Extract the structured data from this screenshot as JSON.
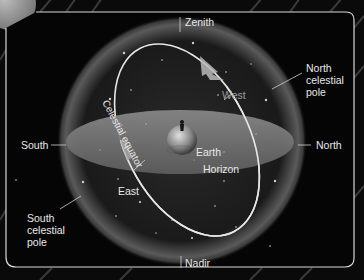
{
  "diagram": {
    "labels": {
      "zenith": "Zenith",
      "nadir": "Nadir",
      "north": "North",
      "south": "South",
      "east": "East",
      "west": "West",
      "earth": "Earth",
      "horizon": "Horizon",
      "celestial_equator": "Celestial equator",
      "north_celestial_pole": "North celestial pole",
      "south_celestial_pole": "South celestial pole"
    },
    "colors": {
      "background": "#0a0a0a",
      "frame": "#d8d8d8",
      "sphere_glow": "#6e6e6e",
      "horizon_disk": "#7a7a7a",
      "equator_ring": "#e6e6e6",
      "arrow": "#b8b8b8",
      "label": "#e8e8e8",
      "label_dim": "#9a9a9a"
    }
  }
}
